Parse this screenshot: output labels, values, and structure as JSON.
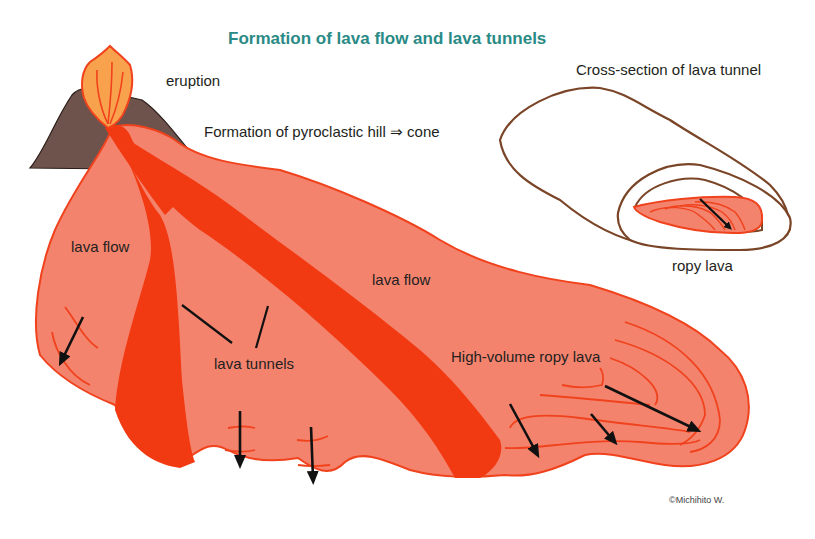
{
  "title": "Formation of lava flow and lava tunnels",
  "labels": {
    "eruption": "eruption",
    "pyroclastic": "Formation of pyroclastic hill ⇒ cone",
    "lava_flow_left": "lava flow",
    "lava_flow_center": "lava flow",
    "lava_tunnels": "lava tunnels",
    "high_volume_ropy_lava": "High-volume ropy lava",
    "cross_section_title": "Cross-section of lava tunnel",
    "ropy_lava": "ropy lava"
  },
  "credit": "©Michihito W.",
  "colors": {
    "title": "#2a8a86",
    "lava_flow_fill": "#f4836e",
    "lava_outline": "#f0421c",
    "lava_tunnel": "#f23a12",
    "cone": "#6e524c",
    "eruption_plume": "#f9a24e",
    "cross_section_outline": "#7a4426",
    "arrow": "#111111",
    "text": "#231f20"
  }
}
